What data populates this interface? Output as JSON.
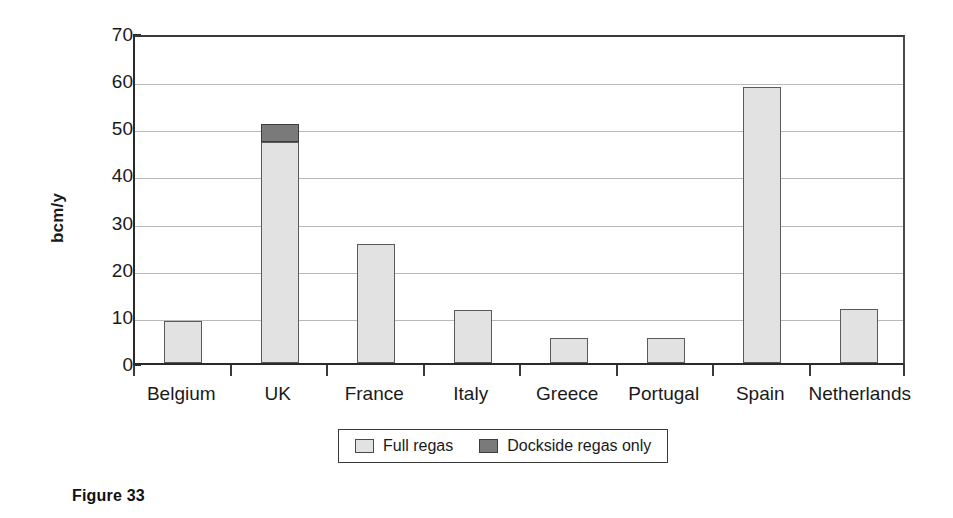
{
  "caption": "Figure 33",
  "legend": {
    "position": "below-axis",
    "entries": [
      {
        "label": "Full regas",
        "color": "#e2e2e2",
        "swatch": "light-gray-swatch"
      },
      {
        "label": "Dockside regas only",
        "color": "#7a7a7a",
        "swatch": "dark-gray-swatch"
      }
    ]
  },
  "axes": {
    "y_title": "bcm/y",
    "y_ticks": [
      "70",
      "60",
      "50",
      "40",
      "30",
      "20",
      "10",
      "0"
    ],
    "x_labels": [
      "Belgium",
      "UK",
      "France",
      "Italy",
      "Greece",
      "Portugal",
      "Spain",
      "Netherlands"
    ]
  },
  "chart_data": {
    "type": "bar",
    "title": "",
    "subtitle": "",
    "xlabel": "",
    "ylabel": "bcm/y",
    "ylim": [
      0,
      70
    ],
    "ytick_step": 10,
    "grid": true,
    "stacked": true,
    "legend_position": "bottom",
    "categories": [
      "Belgium",
      "UK",
      "France",
      "Italy",
      "Greece",
      "Portugal",
      "Spain",
      "Netherlands"
    ],
    "series": [
      {
        "name": "Full regas",
        "color": "#e2e2e2",
        "values": [
          8.9,
          46.9,
          25.3,
          11.3,
          5.3,
          5.3,
          58.5,
          11.5
        ]
      },
      {
        "name": "Dockside regas only",
        "color": "#7a7a7a",
        "values": [
          0,
          3.7,
          0,
          0,
          0,
          0,
          0,
          0
        ]
      }
    ],
    "totals": [
      8.9,
      50.6,
      25.3,
      11.3,
      5.3,
      5.3,
      58.5,
      11.5
    ]
  }
}
